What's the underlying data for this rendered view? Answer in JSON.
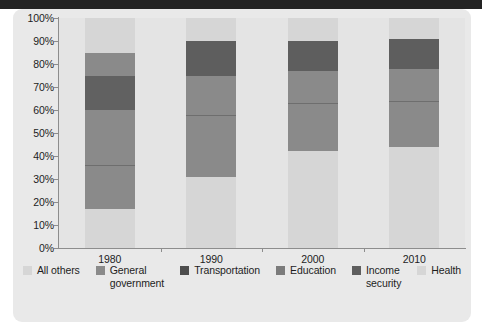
{
  "chart_data": {
    "type": "bar",
    "subtype": "stacked-100-percent",
    "title": "",
    "xlabel": "",
    "ylabel": "",
    "categories": [
      "1980",
      "1990",
      "2000",
      "2010"
    ],
    "ylim": [
      0,
      100
    ],
    "ytick_labels": [
      "0%",
      "10%",
      "20%",
      "30%",
      "40%",
      "50%",
      "60%",
      "70%",
      "80%",
      "90%",
      "100%"
    ],
    "ytick_values": [
      0,
      10,
      20,
      30,
      40,
      50,
      60,
      70,
      80,
      90,
      100
    ],
    "grid": false,
    "legend_position": "bottom",
    "stack_order_bottom_to_top": [
      "All others",
      "General government",
      "Transportation",
      "Education",
      "Income security",
      "Health"
    ],
    "series": [
      {
        "name": "All others",
        "color": "#d5d5d5",
        "values": [
          17,
          31,
          42,
          44
        ]
      },
      {
        "name": "General government",
        "color": "#8c8c8c",
        "values": [
          19,
          27,
          21,
          20
        ]
      },
      {
        "name": "Transportation",
        "color": "#8c8c8c",
        "values": [
          24,
          17,
          14,
          14
        ]
      },
      {
        "name": "Education",
        "color": "#6a6a6a",
        "values": [
          15,
          0,
          0,
          0
        ]
      },
      {
        "name": "Income security",
        "color": "#5a5a5a",
        "values": [
          10,
          15,
          13,
          13
        ]
      },
      {
        "name": "Health",
        "color": "#d5d5d5",
        "values": [
          15,
          10,
          10,
          9
        ]
      }
    ],
    "bars": [
      {
        "category": "1980",
        "segments": [
          {
            "name": "All others",
            "from": 0,
            "to": 17,
            "value": 17,
            "color": "#d6d6d6"
          },
          {
            "name": "General government",
            "from": 17,
            "to": 36,
            "value": 19,
            "color": "#8a8a8a"
          },
          {
            "name": "Transportation",
            "from": 36,
            "to": 60,
            "value": 24,
            "color": "#8a8a8a"
          },
          {
            "name": "Education",
            "from": 60,
            "to": 75,
            "value": 15,
            "color": "#616161"
          },
          {
            "name": "Income security",
            "from": 75,
            "to": 85,
            "value": 10,
            "color": "#8a8a8a"
          },
          {
            "name": "Health",
            "from": 85,
            "to": 100,
            "value": 15,
            "color": "#d6d6d6"
          }
        ]
      },
      {
        "category": "1990",
        "segments": [
          {
            "name": "All others",
            "from": 0,
            "to": 31,
            "value": 31,
            "color": "#d6d6d6"
          },
          {
            "name": "General government",
            "from": 31,
            "to": 58,
            "value": 27,
            "color": "#8a8a8a"
          },
          {
            "name": "Transportation",
            "from": 58,
            "to": 75,
            "value": 17,
            "color": "#8a8a8a"
          },
          {
            "name": "Education",
            "from": 75,
            "to": 75,
            "value": 0,
            "color": "#616161"
          },
          {
            "name": "Income security",
            "from": 75,
            "to": 90,
            "value": 15,
            "color": "#5e5e5e"
          },
          {
            "name": "Health",
            "from": 90,
            "to": 100,
            "value": 10,
            "color": "#d6d6d6"
          }
        ]
      },
      {
        "category": "2000",
        "segments": [
          {
            "name": "All others",
            "from": 0,
            "to": 42,
            "value": 42,
            "color": "#d6d6d6"
          },
          {
            "name": "General government",
            "from": 42,
            "to": 63,
            "value": 21,
            "color": "#8a8a8a"
          },
          {
            "name": "Transportation",
            "from": 63,
            "to": 77,
            "value": 14,
            "color": "#8a8a8a"
          },
          {
            "name": "Education",
            "from": 77,
            "to": 77,
            "value": 0,
            "color": "#616161"
          },
          {
            "name": "Income security",
            "from": 77,
            "to": 90,
            "value": 13,
            "color": "#5e5e5e"
          },
          {
            "name": "Health",
            "from": 90,
            "to": 100,
            "value": 10,
            "color": "#d6d6d6"
          }
        ]
      },
      {
        "category": "2010",
        "segments": [
          {
            "name": "All others",
            "from": 0,
            "to": 44,
            "value": 44,
            "color": "#d6d6d6"
          },
          {
            "name": "General government",
            "from": 44,
            "to": 64,
            "value": 20,
            "color": "#8a8a8a"
          },
          {
            "name": "Transportation",
            "from": 64,
            "to": 78,
            "value": 14,
            "color": "#8a8a8a"
          },
          {
            "name": "Education",
            "from": 78,
            "to": 78,
            "value": 0,
            "color": "#616161"
          },
          {
            "name": "Income security",
            "from": 78,
            "to": 91,
            "value": 13,
            "color": "#5e5e5e"
          },
          {
            "name": "Health",
            "from": 91,
            "to": 100,
            "value": 9,
            "color": "#d6d6d6"
          }
        ]
      }
    ],
    "legend": [
      {
        "label": "All others",
        "color": "#d6d6d6"
      },
      {
        "label": "General\ngovernment",
        "color": "#8a8a8a"
      },
      {
        "label": "Transportation",
        "color": "#4d4d4d"
      },
      {
        "label": "Education",
        "color": "#7b7b7b"
      },
      {
        "label": "Income\nsecurity",
        "color": "#5e5e5e"
      },
      {
        "label": "Health",
        "color": "#d6d6d6"
      }
    ]
  },
  "colors": {
    "panel_background": "#e9e9e9",
    "plot_background": "#e4e4e4",
    "axis": "#8d8d8d",
    "text": "#1d1d1d",
    "top_band": "#232323"
  }
}
